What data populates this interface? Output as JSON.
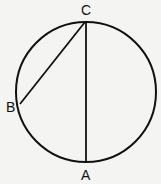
{
  "diagram": {
    "type": "circle-with-chords",
    "circle": {
      "cx": 86,
      "cy": 92,
      "r": 70
    },
    "points": [
      {
        "id": "C",
        "label": "C",
        "x": 86,
        "y": 21
      },
      {
        "id": "B",
        "label": "B",
        "x": 20,
        "y": 104
      },
      {
        "id": "A",
        "label": "A",
        "x": 86,
        "y": 163
      }
    ],
    "segments": [
      {
        "from": "C",
        "to": "A"
      },
      {
        "from": "C",
        "to": "B"
      }
    ],
    "stroke_color": "#111111",
    "background": "#f4f4f2"
  }
}
